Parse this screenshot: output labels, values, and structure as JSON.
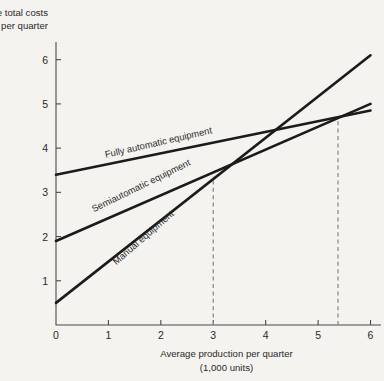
{
  "chart_data": {
    "type": "line",
    "title": "",
    "ylabel": "Average total costs per quarter",
    "xlabel": "Average production per quarter (1,000 units)",
    "xlabel_line1": "Average production per quarter",
    "xlabel_line2": "(1,000 units)",
    "ylabel_line1": "Average total costs",
    "ylabel_line2": "per quarter",
    "xlim": [
      0,
      6.2
    ],
    "ylim": [
      0,
      6.4
    ],
    "xticks": [
      0,
      1,
      2,
      3,
      4,
      5,
      6
    ],
    "xtick_labels": [
      "0",
      "1",
      "2",
      "3",
      "4",
      "5",
      "6"
    ],
    "yticks": [
      1,
      2,
      3,
      4,
      5,
      6
    ],
    "ytick_labels": [
      "1",
      "2",
      "3",
      "4",
      "5",
      "6"
    ],
    "grid": false,
    "legend_position": "inline-on-line",
    "line_color": "#1b1b1b",
    "guide_color": "#8d8d8a",
    "background_color": "#f4f3f0",
    "series": [
      {
        "name": "Manual equipment",
        "label": "Manual equipment",
        "x": [
          0,
          6
        ],
        "values": [
          0.5,
          6.1
        ],
        "label_x": 1.15,
        "label_y": 1.35,
        "label_rotation": -41
      },
      {
        "name": "Semiautomatic equipment",
        "label": "Semiautomatic equipment",
        "x": [
          0,
          6
        ],
        "values": [
          1.9,
          5.0
        ],
        "label_x": 0.72,
        "label_y": 2.55,
        "label_rotation": -26
      },
      {
        "name": "Fully automatic equipment",
        "label": "Fully automatic equipment",
        "x": [
          0,
          6
        ],
        "values": [
          3.4,
          4.85
        ],
        "label_x": 0.95,
        "label_y": 3.78,
        "label_rotation": -13
      }
    ],
    "annotations": [
      {
        "name": "breakeven-manual-semiautomatic",
        "type": "vertical-dashed",
        "x": 3.0,
        "y_top": 3.35,
        "y_bottom": 0
      },
      {
        "name": "breakeven-semiautomatic-fullyautomatic",
        "type": "vertical-dashed",
        "x": 5.38,
        "y_top": 4.7,
        "y_bottom": 0
      }
    ]
  }
}
